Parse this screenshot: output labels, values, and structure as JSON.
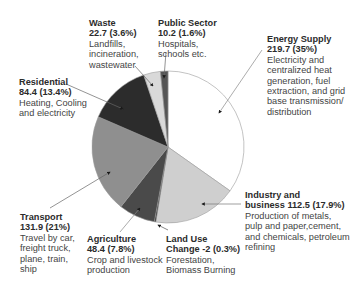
{
  "chart_data": {
    "type": "pie",
    "title": "",
    "start_angle": "12 o'clock",
    "direction": "clockwise",
    "unit": "",
    "slices": [
      {
        "name": "Energy Supply",
        "value": 219.7,
        "percent": 35,
        "value_label": "219.7 (35%)",
        "description": "Electricity and centralized heat generation, fuel extraction, and grid base transmission/ distribution",
        "color": "#ffffff"
      },
      {
        "name": "Industry and business",
        "value": 112.5,
        "percent": 17.9,
        "value_label": "112.5 (17.9%)",
        "description": "Production of metals, pulp and paper,cement, and chemicals, petroleum refining",
        "color": "#cfcfcf"
      },
      {
        "name": "Land Use Change",
        "value": -2,
        "percent": 0.3,
        "value_label": "-2 (0.3%)",
        "description": "Forestation, Biomass Burning",
        "color": "#1e1e1e"
      },
      {
        "name": "Agriculture",
        "value": 48.4,
        "percent": 7.8,
        "value_label": "48.4 (7.8%)",
        "description": "Crop and livestock production",
        "color": "#4a4a4a"
      },
      {
        "name": "Transport",
        "value": 131.9,
        "percent": 21,
        "value_label": "131.9 (21%)",
        "description": "Travel by car, freight truck, plane, train, ship",
        "color": "#8f8f8f"
      },
      {
        "name": "Residential",
        "value": 84.4,
        "percent": 13.4,
        "value_label": "84.4 (13.4%)",
        "description": "Heating, Cooling and electricity",
        "color": "#2c2c2c"
      },
      {
        "name": "Waste",
        "value": 22.7,
        "percent": 3.6,
        "value_label": "22.7 (3.6%)",
        "description": "Landfills, incineration, wastewater",
        "color": "#d9d9d9"
      },
      {
        "name": "Public Sector",
        "value": 10.2,
        "percent": 1.6,
        "value_label": "10.2 (1.6%)",
        "description": "Hospitals, schools etc.",
        "color": "#555555"
      }
    ],
    "legend": "none (callout labels with arrows)"
  },
  "labels": {
    "waste": {
      "title": "Waste",
      "value": "22.7 (3.6%)",
      "lines": [
        "Landfills,",
        "incineration,",
        "wastewater"
      ]
    },
    "public_sector": {
      "title": "Public Sector",
      "value": "10.2 (1.6%)",
      "lines": [
        "Hospitals,",
        "schools etc."
      ]
    },
    "energy_supply": {
      "title": "Energy Supply",
      "value": "219.7 (35%)",
      "lines": [
        "Electricity and",
        "centralized heat",
        "generation, fuel",
        "extraction, and grid",
        "base transmission/",
        "distribution"
      ]
    },
    "residential": {
      "title": "Residential",
      "value": "84.4 (13.4%)",
      "lines": [
        "Heating, Cooling",
        "and electricity"
      ]
    },
    "industry": {
      "title": "Industry and",
      "title2": "business",
      "value": "112.5 (17.9%)",
      "lines": [
        "Production of metals,",
        "pulp and paper,cement,",
        "and chemicals, petroleum",
        "refining"
      ]
    },
    "transport": {
      "title": "Transport",
      "value": "131.9 (21%)",
      "lines": [
        "Travel by car,",
        "freight truck,",
        "plane, train,",
        "ship"
      ]
    },
    "agriculture": {
      "title": "Agriculture",
      "value": "48.4 (7.8%)",
      "lines": [
        "Crop and livestock",
        "production"
      ]
    },
    "land_use": {
      "title": "Land Use",
      "title2": "Change",
      "value": "-2 (0.3%)",
      "lines": [
        "Forestation,",
        "Biomass Burning"
      ]
    }
  }
}
